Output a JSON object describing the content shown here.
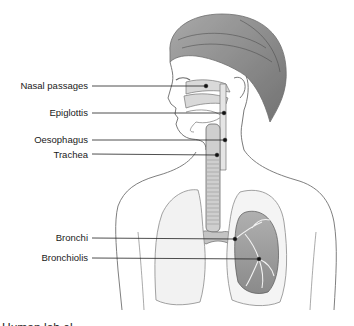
{
  "diagram": {
    "labels": [
      {
        "text": "Nasal passages",
        "y": 86,
        "dot": [
          206,
          86
        ]
      },
      {
        "text": "Epiglottis",
        "y": 113,
        "dot": [
          224,
          113
        ]
      },
      {
        "text": "Oesophagus",
        "y": 140,
        "dot": [
          225,
          140
        ]
      },
      {
        "text": "Trachea",
        "y": 154,
        "dot": [
          217,
          155
        ]
      },
      {
        "text": "Bronchi",
        "y": 238,
        "dot": [
          235,
          239
        ]
      },
      {
        "text": "Bronchiolis",
        "y": 258,
        "dot": [
          259,
          259
        ]
      }
    ],
    "colors": {
      "line": "#222222",
      "sketch": "#6e6e6e",
      "shade": "#bdbdbd",
      "background": "#ffffff"
    },
    "bottom_text_partial": "Human lab el ...  "
  }
}
